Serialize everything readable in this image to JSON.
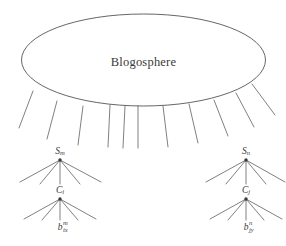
{
  "figure": {
    "kind": "hierarchy-diagram",
    "background_color": "#ffffff",
    "stroke_color": "#555555",
    "text_color": "#3a3a3a"
  },
  "sphere": {
    "label": "Blogosphere",
    "shape": "ellipse",
    "center_x": 143.5,
    "center_y": 60,
    "radius_x": 122,
    "radius_y": 46
  },
  "fan": {
    "count": 11,
    "description": "lines radiating downward from the bottom of the blogosphere ellipse"
  },
  "trees": [
    {
      "id": "left",
      "site": {
        "base": "S",
        "sub": "m",
        "sup": "",
        "x": 60,
        "y": 152,
        "children": 5
      },
      "category": {
        "base": "C",
        "sub": "i",
        "sup": "",
        "x": 60,
        "y": 191,
        "children": 5
      },
      "blog": {
        "base": "b",
        "sub": "ix",
        "sup": "m",
        "x": 60,
        "y": 227
      }
    },
    {
      "id": "right",
      "site": {
        "base": "S",
        "sub": "n",
        "sup": "",
        "x": 246,
        "y": 152,
        "children": 5
      },
      "category": {
        "base": "C",
        "sub": "j",
        "sup": "",
        "x": 246,
        "y": 191,
        "children": 5
      },
      "blog": {
        "base": "b",
        "sub": "jy",
        "sup": "n",
        "x": 246,
        "y": 227
      }
    }
  ],
  "labels": {
    "sphere": "Blogosphere",
    "left_site": "S",
    "left_site_sub": "m",
    "left_category": "C",
    "left_category_sub": "i",
    "left_blog": "b",
    "left_blog_sub": "ix",
    "left_blog_sup": "m",
    "right_site": "S",
    "right_site_sub": "n",
    "right_category": "C",
    "right_category_sub": "j",
    "right_blog": "b",
    "right_blog_sub": "jy",
    "right_blog_sup": "n"
  }
}
